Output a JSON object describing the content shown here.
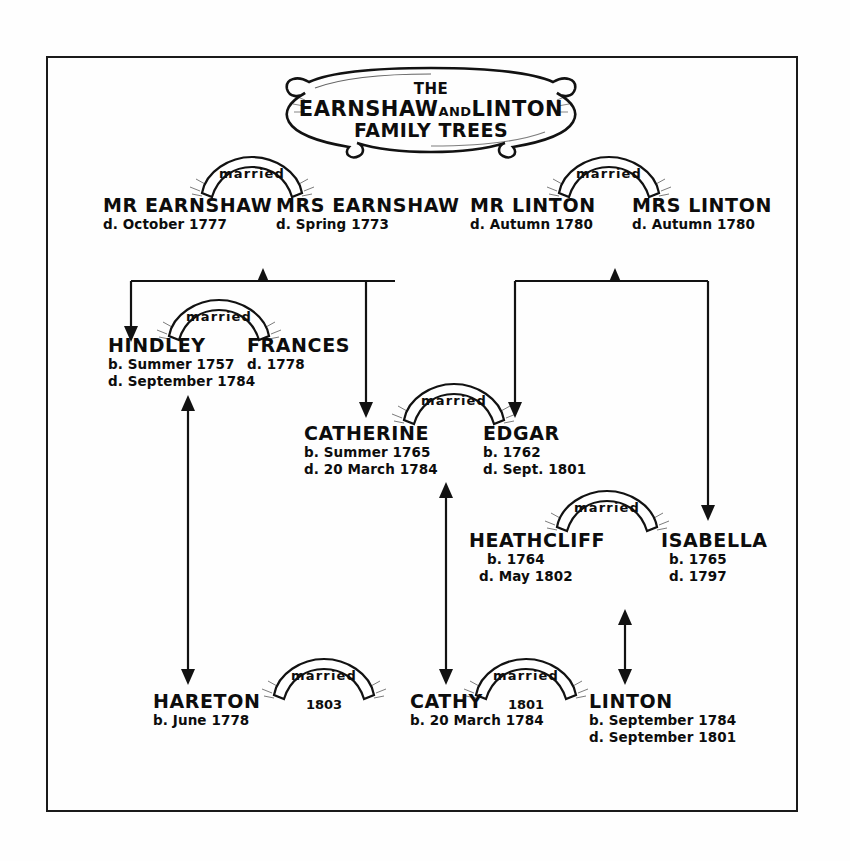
{
  "title": {
    "line1": "THE",
    "line2_a": "EARNSHAW",
    "line2_b": "AND",
    "line2_c": "LINTON",
    "line3": "FAMILY TREES"
  },
  "labels": {
    "married": "married"
  },
  "people": [
    {
      "id": "mr-earnshaw",
      "name": "MR EARNSHAW",
      "dates": [
        "d. October 1777"
      ]
    },
    {
      "id": "mrs-earnshaw",
      "name": "MRS EARNSHAW",
      "dates": [
        "d. Spring 1773"
      ]
    },
    {
      "id": "mr-linton",
      "name": "MR LINTON",
      "dates": [
        "d. Autumn 1780"
      ]
    },
    {
      "id": "mrs-linton",
      "name": "MRS LINTON",
      "dates": [
        "d. Autumn 1780"
      ]
    },
    {
      "id": "hindley",
      "name": "HINDLEY",
      "dates": [
        "b. Summer 1757",
        "d. September 1784"
      ]
    },
    {
      "id": "frances",
      "name": "FRANCES",
      "dates": [
        "d. 1778"
      ]
    },
    {
      "id": "catherine",
      "name": "CATHERINE",
      "dates": [
        "b. Summer 1765",
        "d. 20 March 1784"
      ]
    },
    {
      "id": "edgar",
      "name": "EDGAR",
      "dates": [
        "b. 1762",
        "d. Sept. 1801"
      ]
    },
    {
      "id": "heathcliff",
      "name": "HEATHCLIFF",
      "dates": [
        "b. 1764",
        "d. May 1802"
      ]
    },
    {
      "id": "isabella",
      "name": "ISABELLA",
      "dates": [
        "b. 1765",
        "d. 1797"
      ]
    },
    {
      "id": "hareton",
      "name": "HARETON",
      "dates": [
        "b. June 1778"
      ]
    },
    {
      "id": "cathy",
      "name": "CATHY",
      "dates": [
        "b. 20 March 1784"
      ]
    },
    {
      "id": "linton",
      "name": "LINTON",
      "dates": [
        "b. September 1784",
        "d. September 1801"
      ]
    }
  ],
  "marriages": [
    {
      "id": "earnshaw-marriage",
      "label": "married",
      "year": ""
    },
    {
      "id": "linton-marriage",
      "label": "married",
      "year": ""
    },
    {
      "id": "hindley-frances",
      "label": "married",
      "year": ""
    },
    {
      "id": "catherine-edgar",
      "label": "married",
      "year": ""
    },
    {
      "id": "heathcliff-isabella",
      "label": "married",
      "year": ""
    },
    {
      "id": "hareton-cathy",
      "label": "married",
      "year": "1803"
    },
    {
      "id": "cathy-linton",
      "label": "married",
      "year": "1801"
    }
  ],
  "colors": {
    "ink": "#121212",
    "paper": "#fefefe"
  }
}
